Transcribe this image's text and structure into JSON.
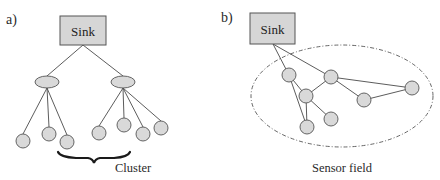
{
  "colors": {
    "node_fill": "#d9d9d9",
    "node_stroke": "#555555",
    "edge": "#4a4a4a",
    "sink_fill": "#d6d6d6",
    "background": "#ffffff"
  },
  "panel_a": {
    "label": "a)",
    "sink": {
      "label": "Sink",
      "x": 60,
      "y": 16,
      "w": 46,
      "h": 29
    },
    "cluster_heads": [
      {
        "cx": 47,
        "cy": 82,
        "rx": 12,
        "ry": 6
      },
      {
        "cx": 123,
        "cy": 82,
        "rx": 12,
        "ry": 6
      }
    ],
    "leaves": [
      {
        "cx": 23,
        "cy": 141,
        "head": 0
      },
      {
        "cx": 49,
        "cy": 134,
        "head": 0
      },
      {
        "cx": 67,
        "cy": 142,
        "head": 0
      },
      {
        "cx": 99,
        "cy": 133,
        "head": 1
      },
      {
        "cx": 124,
        "cy": 125,
        "head": 1
      },
      {
        "cx": 143,
        "cy": 134,
        "head": 1
      },
      {
        "cx": 161,
        "cy": 128,
        "head": 1
      }
    ],
    "brace_label": "Cluster"
  },
  "panel_b": {
    "label": "b)",
    "sink": {
      "label": "Sink",
      "x": 250,
      "y": 13,
      "w": 45,
      "h": 31
    },
    "field": {
      "cx": 342,
      "cy": 96,
      "rx": 91,
      "ry": 51,
      "label": "Sensor field"
    },
    "nodes": [
      {
        "id": "A",
        "cx": 289,
        "cy": 75
      },
      {
        "id": "B",
        "cx": 331,
        "cy": 77
      },
      {
        "id": "C",
        "cx": 306,
        "cy": 96
      },
      {
        "id": "D",
        "cx": 364,
        "cy": 100
      },
      {
        "id": "E",
        "cx": 412,
        "cy": 88
      },
      {
        "id": "F",
        "cx": 331,
        "cy": 119
      },
      {
        "id": "G",
        "cx": 307,
        "cy": 127
      }
    ],
    "edges": [
      [
        "Sink",
        "A"
      ],
      [
        "Sink",
        "B"
      ],
      [
        "A",
        "C"
      ],
      [
        "A",
        "G"
      ],
      [
        "B",
        "C"
      ],
      [
        "B",
        "D"
      ],
      [
        "B",
        "E"
      ],
      [
        "D",
        "E"
      ],
      [
        "C",
        "F"
      ],
      [
        "C",
        "G"
      ]
    ]
  }
}
